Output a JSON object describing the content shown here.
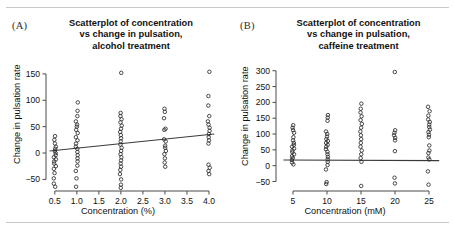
{
  "figure": {
    "rules": {
      "top": true,
      "bottom": true
    }
  },
  "panels": [
    {
      "letter": "(A)",
      "title_lines": [
        "Scatterplot of concentration",
        "vs change in pulsation,",
        "alcohol treatment"
      ],
      "xlabel": "Concentration (%)",
      "ylabel": "Change in pulsation rate"
    },
    {
      "letter": "(B)",
      "title_lines": [
        "Scatterplot of concentration",
        "vs change in pulsation,",
        "caffeine treatment"
      ],
      "xlabel": "Concentration (mM)",
      "ylabel": "Change in pulsation rate"
    }
  ],
  "chart_data": [
    {
      "type": "scatter",
      "panel": "A",
      "title": "Scatterplot of concentration vs change in pulsation, alcohol treatment",
      "xlabel": "Concentration (%)",
      "ylabel": "Change in pulsation rate",
      "xlim": [
        0.3,
        4.25
      ],
      "ylim": [
        -72,
        165
      ],
      "xticks": [
        0.5,
        1.0,
        1.5,
        2.0,
        2.5,
        3.0,
        3.5,
        4.0
      ],
      "xticklabels": [
        "0.5",
        "1.0",
        "1.5",
        "2.0",
        "2.5",
        "3.0",
        "3.5",
        "4.0"
      ],
      "yticks": [
        -50,
        0,
        50,
        100,
        150
      ],
      "yticklabels": [
        "−50",
        "0",
        "50",
        "100",
        "150"
      ],
      "grid": false,
      "legend": false,
      "marker": "open-circle",
      "trendline": {
        "type": "linear",
        "x": [
          0.38,
          4.12
        ],
        "y": [
          4,
          36
        ]
      },
      "points": [
        [
          0.5,
          32
        ],
        [
          0.5,
          25
        ],
        [
          0.5,
          18
        ],
        [
          0.5,
          12
        ],
        [
          0.5,
          8
        ],
        [
          0.5,
          4
        ],
        [
          0.5,
          0
        ],
        [
          0.5,
          -4
        ],
        [
          0.5,
          -8
        ],
        [
          0.5,
          -12
        ],
        [
          0.5,
          -16
        ],
        [
          0.5,
          -20
        ],
        [
          0.5,
          -25
        ],
        [
          0.5,
          -30
        ],
        [
          0.5,
          -38
        ],
        [
          0.5,
          -48
        ],
        [
          0.5,
          -58
        ],
        [
          0.5,
          -64
        ],
        [
          1.0,
          96
        ],
        [
          1.0,
          80
        ],
        [
          1.0,
          70
        ],
        [
          1.0,
          60
        ],
        [
          1.0,
          54
        ],
        [
          1.0,
          50
        ],
        [
          1.0,
          44
        ],
        [
          1.0,
          38
        ],
        [
          1.0,
          30
        ],
        [
          1.0,
          24
        ],
        [
          1.0,
          18
        ],
        [
          1.0,
          12
        ],
        [
          1.0,
          8
        ],
        [
          1.0,
          2
        ],
        [
          1.0,
          -4
        ],
        [
          1.0,
          -10
        ],
        [
          1.0,
          -16
        ],
        [
          1.0,
          -24
        ],
        [
          1.0,
          -34
        ],
        [
          1.0,
          -48
        ],
        [
          1.0,
          -64
        ],
        [
          2.0,
          152
        ],
        [
          2.0,
          76
        ],
        [
          2.0,
          70
        ],
        [
          2.0,
          64
        ],
        [
          2.0,
          58
        ],
        [
          2.0,
          52
        ],
        [
          2.0,
          46
        ],
        [
          2.0,
          40
        ],
        [
          2.0,
          34
        ],
        [
          2.0,
          28
        ],
        [
          2.0,
          22
        ],
        [
          2.0,
          16
        ],
        [
          2.0,
          10
        ],
        [
          2.0,
          4
        ],
        [
          2.0,
          -2
        ],
        [
          2.0,
          -8
        ],
        [
          2.0,
          -14
        ],
        [
          2.0,
          -20
        ],
        [
          2.0,
          -26
        ],
        [
          2.0,
          -32
        ],
        [
          2.0,
          -40
        ],
        [
          2.0,
          -50
        ],
        [
          2.0,
          -60
        ],
        [
          2.0,
          -66
        ],
        [
          3.0,
          84
        ],
        [
          3.0,
          78
        ],
        [
          3.0,
          66
        ],
        [
          3.0,
          46
        ],
        [
          3.0,
          44
        ],
        [
          3.0,
          26
        ],
        [
          3.0,
          22
        ],
        [
          3.0,
          14
        ],
        [
          3.0,
          10
        ],
        [
          3.0,
          4
        ],
        [
          3.0,
          -2
        ],
        [
          3.0,
          -10
        ],
        [
          3.0,
          -18
        ],
        [
          3.0,
          -26
        ],
        [
          4.0,
          154
        ],
        [
          4.0,
          108
        ],
        [
          4.0,
          90
        ],
        [
          4.0,
          70
        ],
        [
          4.0,
          60
        ],
        [
          4.0,
          54
        ],
        [
          4.0,
          48
        ],
        [
          4.0,
          42
        ],
        [
          4.0,
          36
        ],
        [
          4.0,
          30
        ],
        [
          4.0,
          24
        ],
        [
          4.0,
          18
        ],
        [
          4.0,
          -22
        ],
        [
          4.0,
          -28
        ],
        [
          4.0,
          -34
        ],
        [
          4.0,
          -40
        ]
      ]
    },
    {
      "type": "scatter",
      "panel": "B",
      "title": "Scatterplot of concentration vs change in pulsation, caffeine treatment",
      "xlabel": "Concentration (mM)",
      "ylabel": "Change in pulsation rate",
      "xlim": [
        2.5,
        27.5
      ],
      "ylim": [
        -80,
        315
      ],
      "xticks": [
        5,
        10,
        15,
        20,
        25
      ],
      "xticklabels": [
        "5",
        "10",
        "15",
        "20",
        "25"
      ],
      "yticks": [
        -50,
        0,
        50,
        100,
        150,
        200,
        250,
        300
      ],
      "yticklabels": [
        "−50",
        "0",
        "50",
        "100",
        "150",
        "200",
        "250",
        "300"
      ],
      "grid": false,
      "legend": false,
      "marker": "open-circle",
      "trendline": {
        "type": "linear",
        "x": [
          3.6,
          26.5
        ],
        "y": [
          18,
          16
        ]
      },
      "points": [
        [
          5,
          128
        ],
        [
          5,
          120
        ],
        [
          5,
          112
        ],
        [
          5,
          104
        ],
        [
          5,
          90
        ],
        [
          5,
          80
        ],
        [
          5,
          72
        ],
        [
          5,
          66
        ],
        [
          5,
          60
        ],
        [
          5,
          54
        ],
        [
          5,
          48
        ],
        [
          5,
          42
        ],
        [
          5,
          36
        ],
        [
          5,
          30
        ],
        [
          5,
          24
        ],
        [
          5,
          18
        ],
        [
          5,
          10
        ],
        [
          5,
          4
        ],
        [
          10,
          160
        ],
        [
          10,
          152
        ],
        [
          10,
          142
        ],
        [
          10,
          108
        ],
        [
          10,
          100
        ],
        [
          10,
          92
        ],
        [
          10,
          84
        ],
        [
          10,
          78
        ],
        [
          10,
          72
        ],
        [
          10,
          66
        ],
        [
          10,
          60
        ],
        [
          10,
          52
        ],
        [
          10,
          44
        ],
        [
          10,
          36
        ],
        [
          10,
          28
        ],
        [
          10,
          20
        ],
        [
          10,
          12
        ],
        [
          10,
          2
        ],
        [
          10,
          -12
        ],
        [
          10,
          -52
        ],
        [
          10,
          -58
        ],
        [
          15,
          196
        ],
        [
          15,
          180
        ],
        [
          15,
          168
        ],
        [
          15,
          156
        ],
        [
          15,
          144
        ],
        [
          15,
          132
        ],
        [
          15,
          120
        ],
        [
          15,
          108
        ],
        [
          15,
          96
        ],
        [
          15,
          84
        ],
        [
          15,
          72
        ],
        [
          15,
          60
        ],
        [
          15,
          48
        ],
        [
          15,
          36
        ],
        [
          15,
          24
        ],
        [
          15,
          12
        ],
        [
          15,
          -64
        ],
        [
          20,
          296
        ],
        [
          20,
          112
        ],
        [
          20,
          104
        ],
        [
          20,
          96
        ],
        [
          20,
          88
        ],
        [
          20,
          80
        ],
        [
          20,
          46
        ],
        [
          20,
          -38
        ],
        [
          20,
          -56
        ],
        [
          25,
          186
        ],
        [
          25,
          172
        ],
        [
          25,
          158
        ],
        [
          25,
          146
        ],
        [
          25,
          138
        ],
        [
          25,
          130
        ],
        [
          25,
          122
        ],
        [
          25,
          114
        ],
        [
          25,
          106
        ],
        [
          25,
          98
        ],
        [
          25,
          90
        ],
        [
          25,
          64
        ],
        [
          25,
          48
        ],
        [
          25,
          40
        ],
        [
          25,
          26
        ],
        [
          25,
          20
        ],
        [
          25,
          -18
        ],
        [
          25,
          -60
        ]
      ]
    }
  ]
}
